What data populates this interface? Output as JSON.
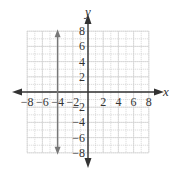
{
  "chart_data": {
    "type": "line",
    "title": "",
    "xlabel": "x",
    "ylabel": "y",
    "xlim": [
      -8,
      8
    ],
    "ylim": [
      -8,
      8
    ],
    "grid": true,
    "x_ticks": [
      -8,
      -6,
      -4,
      -2,
      2,
      4,
      6,
      8
    ],
    "y_ticks": [
      8,
      6,
      4,
      2,
      -2,
      -4,
      -6,
      -8
    ],
    "x_tick_labels": [
      "−8",
      "−6",
      "−4",
      "−2",
      "2",
      "4",
      "6",
      "8"
    ],
    "y_tick_labels": [
      "8",
      "6",
      "4",
      "2",
      "−2",
      "−4",
      "−6",
      "−8"
    ],
    "series": [
      {
        "name": "x = -4",
        "kind": "vertical-line",
        "x": [
          -4,
          -4
        ],
        "y": [
          -8,
          8
        ],
        "arrows": "both",
        "color": "#777777"
      }
    ]
  },
  "colors": {
    "axis": "#333333",
    "grid": "#bbbbbb",
    "line": "#777777"
  }
}
